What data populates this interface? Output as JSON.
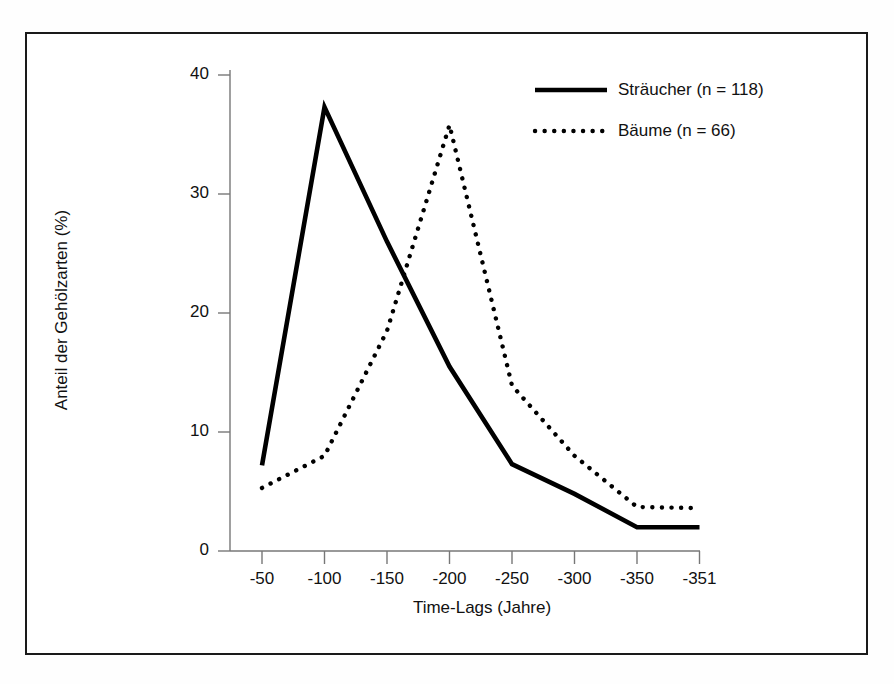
{
  "chart_data": {
    "type": "line",
    "title": "",
    "xlabel": "Time-Lags (Jahre)",
    "ylabel": "Anteil der Gehölzarten (%)",
    "categories": [
      "-50",
      "-100",
      "-150",
      "-200",
      "-250",
      "-300",
      "-350",
      "-351"
    ],
    "xticklabels": [
      "-50",
      "-100",
      "-150",
      "-200",
      "-250",
      "-300",
      "-350",
      "-351"
    ],
    "yticklabels": [
      "0",
      "10",
      "20",
      "30",
      "40"
    ],
    "yticks": [
      0,
      10,
      20,
      30,
      40
    ],
    "ylim": [
      0,
      40
    ],
    "grid": false,
    "legend_position": "top-right",
    "series": [
      {
        "name": "Sträucher (n = 118)",
        "style": "solid",
        "color": "#000000",
        "values": [
          7.2,
          37.3,
          26.0,
          15.5,
          7.3,
          4.8,
          2.0,
          2.0
        ]
      },
      {
        "name": "Bäume (n = 66)",
        "style": "dotted",
        "color": "#000000",
        "values": [
          5.3,
          8.0,
          18.5,
          35.8,
          13.9,
          8.0,
          3.7,
          3.6
        ]
      }
    ]
  },
  "legend": {
    "items": [
      {
        "label": "Sträucher (n = 118)",
        "style": "solid"
      },
      {
        "label": "Bäume (n = 66)",
        "style": "dotted"
      }
    ]
  },
  "axes": {
    "x_title": "Time-Lags (Jahre)",
    "y_title": "Anteil der Gehölzarten (%)"
  }
}
